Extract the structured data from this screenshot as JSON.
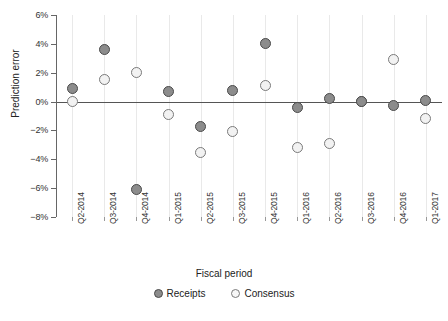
{
  "chart_data": {
    "type": "scatter",
    "title": "",
    "xlabel": "Fiscal period",
    "ylabel": "Prediction error",
    "grid": true,
    "legend_position": "bottom",
    "ylim": [
      -8,
      6
    ],
    "yticks": [
      "6%",
      "4%",
      "2%",
      "0%",
      "-2%",
      "-4%",
      "-6%",
      "-8%"
    ],
    "ytick_values": [
      6,
      4,
      2,
      0,
      -2,
      -4,
      -6,
      -8
    ],
    "categories": [
      "Q2-2014",
      "Q3-2014",
      "Q4-2014",
      "Q1-2015",
      "Q2-2015",
      "Q3-2015",
      "Q4-2015",
      "Q1-2016",
      "Q2-2016",
      "Q3-2016",
      "Q4-2016",
      "Q1-2017"
    ],
    "series": [
      {
        "name": "Receipts",
        "color": "#8c8c8c",
        "edge_color": "#4a4a4a",
        "values": [
          0.9,
          3.6,
          -6.1,
          0.7,
          -1.7,
          0.8,
          4.0,
          -0.4,
          0.2,
          0.0,
          -0.3,
          0.1
        ]
      },
      {
        "name": "Consensus",
        "color": "#f2f2f2",
        "edge_color": "#7a7a7a",
        "values": [
          0.0,
          1.5,
          2.0,
          -0.9,
          -3.5,
          -2.1,
          1.1,
          -3.2,
          -2.9,
          0.0,
          2.9,
          -1.2
        ]
      }
    ]
  },
  "legend": {
    "items": [
      {
        "label": "Receipts",
        "marker": "filled-circle-icon"
      },
      {
        "label": "Consensus",
        "marker": "open-circle-icon"
      }
    ]
  }
}
